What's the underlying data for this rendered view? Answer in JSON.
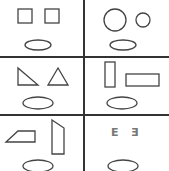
{
  "diagram": {
    "colors": {
      "line": "#333333",
      "shape": "#444444",
      "oval": "#555555",
      "letter": "#777777"
    },
    "cells": [
      {
        "id": "top-left",
        "shapes": [
          "square",
          "square"
        ]
      },
      {
        "id": "top-right",
        "shapes": [
          "large-circle",
          "small-circle"
        ]
      },
      {
        "id": "middle-left",
        "shapes": [
          "right-triangle",
          "isosceles-triangle"
        ]
      },
      {
        "id": "middle-right",
        "shapes": [
          "vertical-rectangle",
          "horizontal-rectangle"
        ]
      },
      {
        "id": "bottom-left",
        "shapes": [
          "parallelogram",
          "trapezoid"
        ]
      },
      {
        "id": "bottom-right",
        "shapes": [
          "letter-E",
          "mirrored-letter-E"
        ],
        "letters": [
          "E",
          "Ǝ"
        ]
      }
    ]
  }
}
